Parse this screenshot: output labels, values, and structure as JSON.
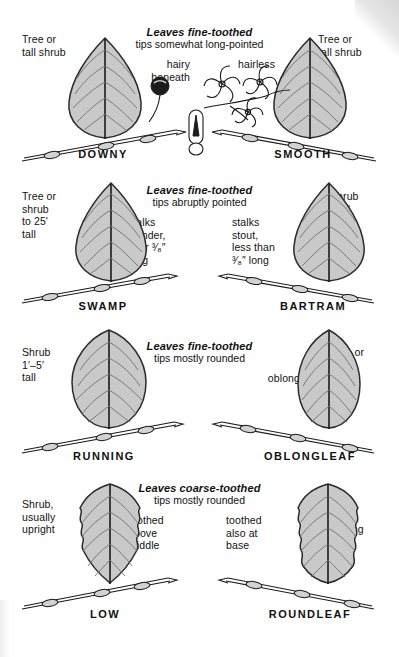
{
  "chart": {
    "background_color": "#ffffff",
    "leaf_fill_color": "#c9c9c9",
    "ink_color": "#111111"
  },
  "rows": [
    {
      "heading_bold": "Leaves fine-toothed",
      "heading_sub": "tips somewhat long-pointed",
      "left": {
        "species": "DOWNY",
        "outer_note": "Tree or\ntall shrub",
        "inner_note": "hairy\nbeneath",
        "leaf_shape": "ovate-pointed"
      },
      "right": {
        "species": "SMOOTH",
        "outer_note": "Tree or\ntall shrub",
        "inner_note": "hairless",
        "leaf_shape": "ovate-pointed"
      },
      "center_art": [
        "berry-on-stalk",
        "seed-capsule",
        "flower-cluster"
      ]
    },
    {
      "heading_bold": "Leaves fine-toothed",
      "heading_sub": "tips abruptly pointed",
      "left": {
        "species": "SWAMP",
        "outer_note": "Tree or\nshrub\nto 25′\ntall",
        "inner_note": "stalks\nslender,\nover ³⁄₈″\nlong",
        "leaf_shape": "ovate-acute"
      },
      "right": {
        "species": "BARTRAM",
        "outer_note": "Shrub\nto 9′\ntall",
        "inner_note": "stalks\nstout,\nless than\n³⁄₈″ long",
        "leaf_shape": "ovate-acute"
      },
      "center_art": []
    },
    {
      "heading_bold": "Leaves fine-toothed",
      "heading_sub": "tips mostly rounded",
      "left": {
        "species": "RUNNING",
        "outer_note": "Shrub\n1′–5′\ntall",
        "inner_note": "oval",
        "leaf_shape": "oval"
      },
      "right": {
        "species": "OBLONGLEAF",
        "outer_note": "Tree or\nshrub\nto 20′\ntall",
        "inner_note": "oblong",
        "leaf_shape": "oblong"
      },
      "center_art": []
    },
    {
      "heading_bold": "Leaves coarse-toothed",
      "heading_sub": "tips mostly rounded",
      "left": {
        "species": "LOW",
        "outer_note": "Shrub,\nusually\nupright",
        "inner_note": "toothed\nabove\nmiddle",
        "leaf_shape": "oval-toothed"
      },
      "right": {
        "species": "ROUNDLEAF",
        "outer_note": "Shrub,\nusually\ndrooping",
        "inner_note": "toothed\nalso at\nbase",
        "leaf_shape": "oval-toothed"
      },
      "center_art": []
    }
  ]
}
